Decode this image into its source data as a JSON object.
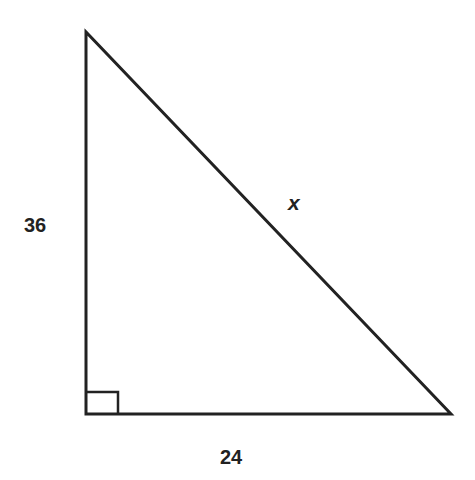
{
  "diagram": {
    "type": "right-triangle",
    "vertices": {
      "top": [
        86,
        32
      ],
      "right_angle": [
        86,
        414
      ],
      "bottom_right": [
        451,
        414
      ]
    },
    "right_angle_marker_size": 32,
    "stroke_color": "#222222",
    "labels": {
      "vertical_leg": "36",
      "horizontal_leg": "24",
      "hypotenuse": "x"
    }
  }
}
